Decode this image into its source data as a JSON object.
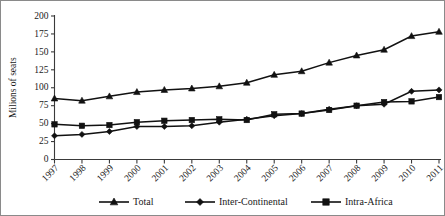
{
  "chart_data": {
    "type": "line",
    "title": "",
    "xlabel": "",
    "ylabel": "Milions of seats",
    "categories": [
      "1997",
      "1998",
      "1999",
      "2000",
      "2001",
      "2002",
      "2003",
      "2004",
      "2005",
      "2006",
      "2007",
      "2008",
      "2009",
      "2010",
      "2011"
    ],
    "ylim": [
      0,
      200
    ],
    "yticks": [
      0,
      25,
      50,
      75,
      100,
      125,
      150,
      175,
      200
    ],
    "ytick_labels": [
      "0",
      "25",
      "50",
      "75",
      "100",
      "125",
      "150",
      "175",
      "200"
    ],
    "grid": false,
    "legend_position": "bottom",
    "series": [
      {
        "name": "Total",
        "marker": "triangle",
        "color": "#111111",
        "values": [
          85,
          82,
          88,
          94,
          97,
          99,
          102,
          107,
          118,
          123,
          135,
          145,
          153,
          172,
          178
        ]
      },
      {
        "name": "Inter-Continental",
        "marker": "diamond",
        "color": "#111111",
        "values": [
          33,
          35,
          39,
          46,
          46,
          47,
          52,
          56,
          61,
          64,
          70,
          75,
          77,
          95,
          97
        ]
      },
      {
        "name": "Intra-Africa",
        "marker": "square",
        "color": "#111111",
        "values": [
          49,
          47,
          48,
          52,
          54,
          55,
          56,
          55,
          63,
          64,
          69,
          75,
          80,
          81,
          87
        ]
      }
    ]
  },
  "legend": {
    "entries": [
      {
        "label": "Total",
        "marker": "triangle"
      },
      {
        "label": "Inter-Continental",
        "marker": "diamond"
      },
      {
        "label": "Intra-Africa",
        "marker": "square"
      }
    ]
  },
  "axes": {
    "y_axis_title": "Milions of seats",
    "x_axis_title": ""
  }
}
